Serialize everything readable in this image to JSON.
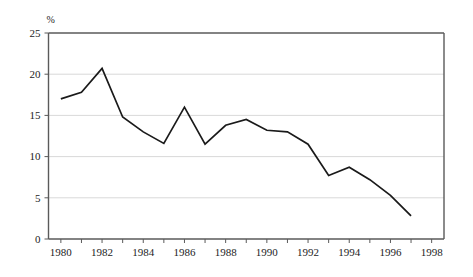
{
  "chart_data": {
    "type": "line",
    "title": "",
    "subtitle": "",
    "xlabel": "",
    "ylabel": "%",
    "unit_label": "%",
    "xlim": [
      1979.4,
      1998.6
    ],
    "ylim": [
      0,
      25
    ],
    "yticks": [
      0,
      5,
      10,
      15,
      20,
      25
    ],
    "ytick_labels": [
      "0",
      "5",
      "10",
      "15",
      "20",
      "25"
    ],
    "xticks": [
      1980,
      1981,
      1982,
      1983,
      1984,
      1985,
      1986,
      1987,
      1988,
      1989,
      1990,
      1991,
      1992,
      1993,
      1994,
      1995,
      1996,
      1997,
      1998
    ],
    "xtick_labels_shown": [
      "1980",
      "1982",
      "1984",
      "1986",
      "1988",
      "1990",
      "1992",
      "1994",
      "1996",
      "1998"
    ],
    "xtick_label_interval": 2,
    "grid": "horizontal",
    "legend": "none",
    "series": [
      {
        "name": "",
        "color": "#1a1a1a",
        "x": [
          1980,
          1981,
          1982,
          1983,
          1984,
          1985,
          1986,
          1987,
          1988,
          1989,
          1990,
          1991,
          1992,
          1993,
          1994,
          1995,
          1996,
          1997
        ],
        "values": [
          17.0,
          17.8,
          20.7,
          14.8,
          13.0,
          11.6,
          16.0,
          11.5,
          13.8,
          14.5,
          13.2,
          13.0,
          11.5,
          7.7,
          8.7,
          7.2,
          5.3,
          2.8
        ]
      }
    ],
    "annotations": []
  }
}
